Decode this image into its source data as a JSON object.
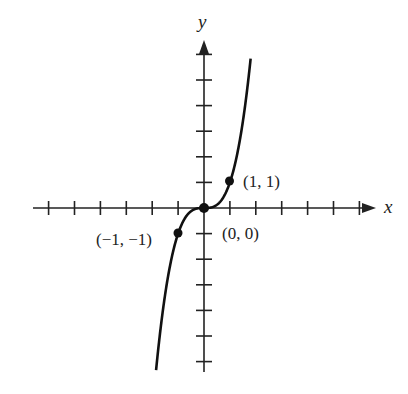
{
  "chart_data": {
    "type": "line",
    "title": "",
    "function": "y = x^3",
    "xlabel": "x",
    "ylabel": "y",
    "xlim": [
      -6.5,
      6.5
    ],
    "ylim": [
      -6.5,
      6.5
    ],
    "x_ticks": [
      -6,
      -5,
      -4,
      -3,
      -2,
      -1,
      1,
      2,
      3,
      4,
      5,
      6
    ],
    "y_ticks": [
      -6,
      -5,
      -4,
      -3,
      -2,
      -1,
      1,
      2,
      3,
      4,
      5,
      6
    ],
    "grid": false,
    "series": [
      {
        "name": "y = x^3",
        "x": [
          -1.9,
          -1.5,
          -1,
          -0.5,
          0,
          0.5,
          1,
          1.5,
          1.6
        ],
        "y": [
          -6.86,
          -3.38,
          -1,
          -0.125,
          0,
          0.125,
          1,
          3.38,
          4.1
        ]
      }
    ],
    "points": [
      {
        "x": -1,
        "y": -1,
        "label": "(−1, −1)"
      },
      {
        "x": 0,
        "y": 0,
        "label": "(0, 0)"
      },
      {
        "x": 1,
        "y": 1,
        "label": "(1, 1)"
      }
    ]
  },
  "labels": {
    "x_axis": "x",
    "y_axis": "y",
    "p_neg": "(−1, −1)",
    "p_origin": "(0, 0)",
    "p_pos": "(1, 1)"
  }
}
